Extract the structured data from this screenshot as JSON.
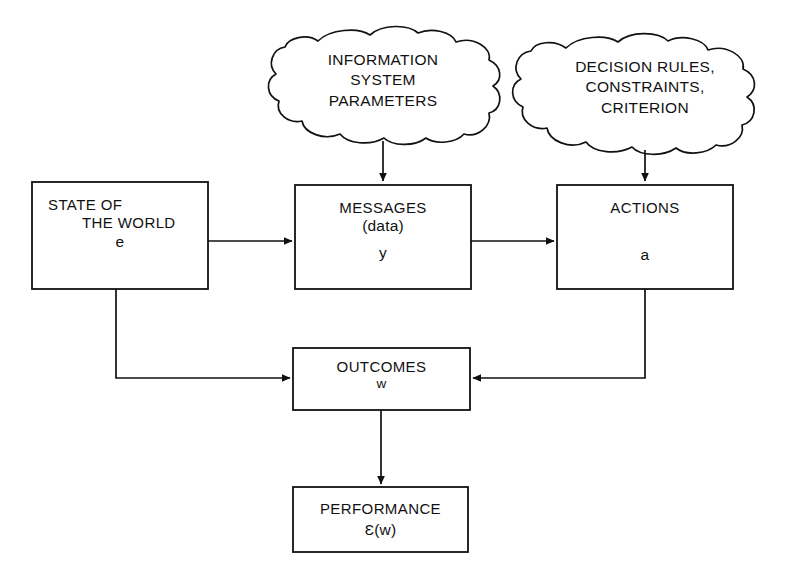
{
  "diagram": {
    "background_color": "#ffffff",
    "line_color": "#111111",
    "nodes": {
      "information_system_parameters": {
        "shape": "cloud",
        "line1": "INFORMATION",
        "line2": "SYSTEM",
        "line3": "PARAMETERS"
      },
      "decision_rules": {
        "shape": "cloud",
        "line1": "DECISION RULES,",
        "line2": "CONSTRAINTS,",
        "line3": "CRITERION"
      },
      "state_of_the_world": {
        "shape": "box",
        "line1": "STATE OF",
        "line2": "THE WORLD",
        "symbol": "e"
      },
      "messages": {
        "shape": "box",
        "line1": "MESSAGES",
        "line2": "(data)",
        "symbol": "y"
      },
      "actions": {
        "shape": "box",
        "line1": "ACTIONS",
        "symbol": "a"
      },
      "outcomes": {
        "shape": "box",
        "line1": "OUTCOMES",
        "symbol": "w"
      },
      "performance": {
        "shape": "box",
        "line1": "PERFORMANCE",
        "symbol": "Ɛ(w)"
      }
    },
    "edges": [
      {
        "name": "isp-to-messages",
        "from": "information_system_parameters",
        "to": "messages",
        "style": "arrow-down"
      },
      {
        "name": "rules-to-actions",
        "from": "decision_rules",
        "to": "actions",
        "style": "arrow-down"
      },
      {
        "name": "state-to-messages",
        "from": "state_of_the_world",
        "to": "messages",
        "style": "arrow-right"
      },
      {
        "name": "messages-to-actions",
        "from": "messages",
        "to": "actions",
        "style": "arrow-right"
      },
      {
        "name": "state-to-outcomes",
        "from": "state_of_the_world",
        "to": "outcomes",
        "style": "elbow-down-right"
      },
      {
        "name": "actions-to-outcomes",
        "from": "actions",
        "to": "outcomes",
        "style": "elbow-down-left"
      },
      {
        "name": "outcomes-to-performance",
        "from": "outcomes",
        "to": "performance",
        "style": "arrow-down"
      }
    ]
  }
}
